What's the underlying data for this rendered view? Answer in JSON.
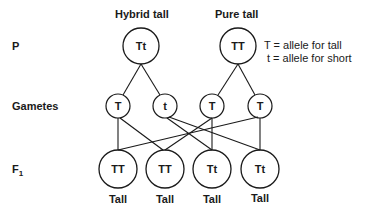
{
  "rows": {
    "parent_label": "P",
    "gametes_label": "Gametes",
    "f1_label": "F",
    "f1_subscript": "1"
  },
  "parents": [
    {
      "title": "Hybrid tall",
      "genotype": "Tt"
    },
    {
      "title": "Pure tall",
      "genotype": "TT"
    }
  ],
  "legend": [
    "T = allele for tall",
    "t = allele for short"
  ],
  "gametes": [
    "T",
    "t",
    "T",
    "T"
  ],
  "offspring": [
    {
      "genotype": "TT",
      "phenotype": "Tall"
    },
    {
      "genotype": "TT",
      "phenotype": "Tall"
    },
    {
      "genotype": "Tt",
      "phenotype": "Tall"
    },
    {
      "genotype": "Tt",
      "phenotype": "Tall"
    }
  ],
  "colors": {
    "stroke": "#1a1a1a",
    "background": "#ffffff"
  }
}
